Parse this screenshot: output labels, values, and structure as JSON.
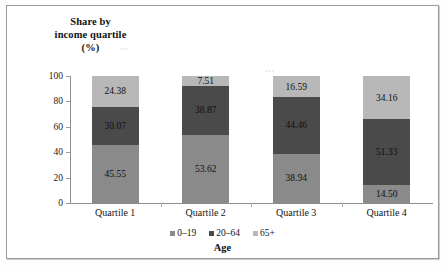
{
  "title": {
    "line1": "Share by",
    "line2": "income quartile",
    "line3": "(%)"
  },
  "axis": {
    "x_title": "Age",
    "y_ticks": [
      "100",
      "80",
      "60",
      "40",
      "20",
      "0"
    ]
  },
  "legend": [
    {
      "label": "0–19",
      "color": "#8a8a8a",
      "name": "legend-item-0-19"
    },
    {
      "label": "20–64",
      "color": "#4a4a4a",
      "name": "legend-item-20-64"
    },
    {
      "label": "65+",
      "color": "#b8b8b8",
      "name": "legend-item-65plus"
    }
  ],
  "categories": [
    "Quartile 1",
    "Quartile 2",
    "Quartile 3",
    "Quartile 4"
  ],
  "bars": [
    {
      "category": "Quartile 1",
      "segments": [
        {
          "series": "65+",
          "value": "24.38",
          "color": "#b8b8b8"
        },
        {
          "series": "20–64",
          "value": "30.07",
          "color": "#4a4a4a"
        },
        {
          "series": "0–19",
          "value": "45.55",
          "color": "#8a8a8a"
        }
      ]
    },
    {
      "category": "Quartile 2",
      "segments": [
        {
          "series": "65+",
          "value": "7.51",
          "color": "#b8b8b8"
        },
        {
          "series": "20–64",
          "value": "38.87",
          "color": "#4a4a4a"
        },
        {
          "series": "0–19",
          "value": "53.62",
          "color": "#8a8a8a"
        }
      ]
    },
    {
      "category": "Quartile 3",
      "segments": [
        {
          "series": "65+",
          "value": "16.59",
          "color": "#b8b8b8"
        },
        {
          "series": "20–64",
          "value": "44.46",
          "color": "#4a4a4a"
        },
        {
          "series": "0–19",
          "value": "38.94",
          "color": "#8a8a8a"
        }
      ]
    },
    {
      "category": "Quartile 4",
      "segments": [
        {
          "series": "65+",
          "value": "34.16",
          "color": "#b8b8b8"
        },
        {
          "series": "20–64",
          "value": "51.33",
          "color": "#4a4a4a"
        },
        {
          "series": "0–19",
          "value": "14.50",
          "color": "#8a8a8a"
        }
      ]
    }
  ],
  "chart_data": {
    "type": "bar",
    "stacked": true,
    "orientation": "vertical",
    "title": "Share by income quartile (%)",
    "xlabel": "Age",
    "ylabel": "Share by income quartile (%)",
    "ylim": [
      0,
      100
    ],
    "yticks": [
      0,
      20,
      40,
      60,
      80,
      100
    ],
    "grid": false,
    "legend_position": "bottom",
    "categories": [
      "Quartile 1",
      "Quartile 2",
      "Quartile 3",
      "Quartile 4"
    ],
    "series": [
      {
        "name": "0–19",
        "color": "#8a8a8a",
        "values": [
          45.55,
          53.62,
          38.94,
          14.5
        ]
      },
      {
        "name": "20–64",
        "color": "#4a4a4a",
        "values": [
          30.07,
          38.87,
          44.46,
          51.33
        ]
      },
      {
        "name": "65+",
        "color": "#b8b8b8",
        "values": [
          24.38,
          7.51,
          16.59,
          34.16
        ]
      }
    ],
    "data_labels": true,
    "totals": [
      100.0,
      100.0,
      99.99,
      99.99
    ]
  }
}
